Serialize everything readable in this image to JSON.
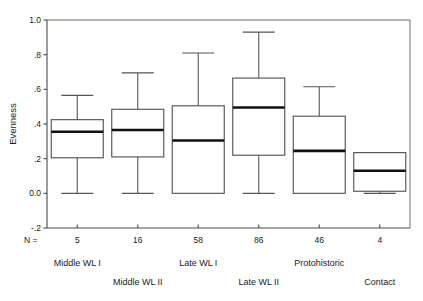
{
  "chart_data": {
    "type": "box",
    "title": "",
    "xlabel": "",
    "ylabel": "Evenness",
    "ylim": [
      -0.2,
      1.0
    ],
    "ytick_labels": [
      "1.0",
      ".8",
      ".6",
      ".4",
      ".2",
      "0.0",
      "-.2"
    ],
    "ytick_values": [
      1.0,
      0.8,
      0.6,
      0.4,
      0.2,
      0.0,
      -0.2
    ],
    "grid": false,
    "legend": null,
    "n_prefix": "N =",
    "categories": [
      "Middle WL I",
      "Middle WL II",
      "Late WL I",
      "Late WL II",
      "Protohistoric",
      "Contact"
    ],
    "counts": [
      5,
      16,
      58,
      86,
      46,
      4
    ],
    "count_labels": [
      "5",
      "16",
      "58",
      "86",
      "46",
      "4"
    ],
    "boxes": [
      {
        "category": "Middle WL I",
        "n": 5,
        "whisker_low": 0.0,
        "q1": 0.205,
        "median": 0.355,
        "q3": 0.425,
        "whisker_high": 0.565
      },
      {
        "category": "Middle WL II",
        "n": 16,
        "whisker_low": 0.0,
        "q1": 0.21,
        "median": 0.365,
        "q3": 0.485,
        "whisker_high": 0.695
      },
      {
        "category": "Late WL I",
        "n": 58,
        "whisker_low": 0.0,
        "q1": 0.0,
        "median": 0.305,
        "q3": 0.505,
        "whisker_high": 0.81
      },
      {
        "category": "Late WL II",
        "n": 86,
        "whisker_low": 0.0,
        "q1": 0.22,
        "median": 0.495,
        "q3": 0.665,
        "whisker_high": 0.93
      },
      {
        "category": "Protohistoric",
        "n": 46,
        "whisker_low": 0.0,
        "q1": 0.0,
        "median": 0.245,
        "q3": 0.445,
        "whisker_high": 0.615
      },
      {
        "category": "Contact",
        "n": 4,
        "whisker_low": 0.0,
        "q1": 0.012,
        "median": 0.13,
        "q3": 0.235,
        "whisker_high": 0.235
      }
    ],
    "colors": {
      "box_stroke": "#555555",
      "box_fill": "#ffffff",
      "median": "#111111",
      "axis": "#4a4a4a",
      "frame": "#6d6d6d",
      "text": "#1a1a1a",
      "background": "#ffffff"
    }
  }
}
